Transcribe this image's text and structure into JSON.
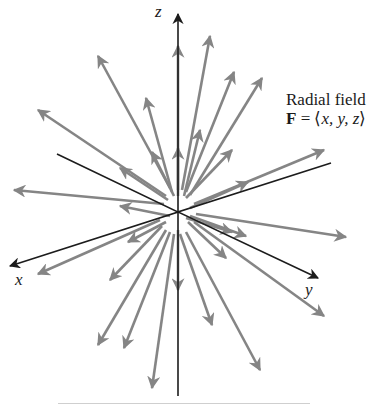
{
  "title": {
    "line1": "Radial field",
    "line2_bold": "F",
    "line2_eq": " = ⟨",
    "line2_vars": "x, y, z",
    "line2_close": "⟩"
  },
  "axes": {
    "x_label": "x",
    "y_label": "y",
    "z_label": "z"
  },
  "colors": {
    "axis": "#1c1c1c",
    "vector": "#858585",
    "background": "#ffffff"
  },
  "diagram": {
    "type": "3d-vector-field",
    "field": "F = <x, y, z>",
    "center": [
      178,
      212
    ],
    "axis_lines": [
      {
        "name": "z-axis",
        "from": [
          178,
          396
        ],
        "to": [
          178,
          14
        ],
        "arrow": true
      },
      {
        "name": "x-axis",
        "from": [
          57,
          154
        ],
        "to": [
          10,
          266
        ],
        "via_center": true,
        "arrow": true
      },
      {
        "name": "y-axis",
        "from": [
          331,
          163
        ],
        "to": [
          318,
          278
        ],
        "via_center": true,
        "arrow": true
      }
    ],
    "vectors": [
      [
        [
          178,
          190
        ],
        [
          178,
          46
        ]
      ],
      [
        [
          182,
          190
        ],
        [
          210,
          36
        ]
      ],
      [
        [
          186,
          192
        ],
        [
          234,
          72
        ]
      ],
      [
        [
          190,
          195
        ],
        [
          262,
          78
        ]
      ],
      [
        [
          170,
          188
        ],
        [
          98,
          56
        ]
      ],
      [
        [
          172,
          192
        ],
        [
          146,
          98
        ]
      ],
      [
        [
          166,
          196
        ],
        [
          38,
          110
        ]
      ],
      [
        [
          164,
          204
        ],
        [
          14,
          190
        ]
      ],
      [
        [
          194,
          204
        ],
        [
          324,
          150
        ]
      ],
      [
        [
          196,
          214
        ],
        [
          346,
          237
        ]
      ],
      [
        [
          194,
          222
        ],
        [
          324,
          316
        ]
      ],
      [
        [
          186,
          232
        ],
        [
          260,
          370
        ]
      ],
      [
        [
          180,
          234
        ],
        [
          212,
          325
        ]
      ],
      [
        [
          174,
          234
        ],
        [
          152,
          388
        ]
      ],
      [
        [
          170,
          232
        ],
        [
          124,
          348
        ]
      ],
      [
        [
          166,
          230
        ],
        [
          98,
          345
        ]
      ],
      [
        [
          162,
          226
        ],
        [
          110,
          280
        ]
      ],
      [
        [
          160,
          220
        ],
        [
          38,
          274
        ]
      ],
      [
        [
          184,
          196
        ],
        [
          200,
          130
        ]
      ],
      [
        [
          186,
          198
        ],
        [
          232,
          150
        ]
      ],
      [
        [
          174,
          196
        ],
        [
          152,
          152
        ]
      ],
      [
        [
          168,
          200
        ],
        [
          120,
          168
        ]
      ],
      [
        [
          190,
          208
        ],
        [
          248,
          182
        ]
      ],
      [
        [
          190,
          216
        ],
        [
          246,
          236
        ]
      ],
      [
        [
          188,
          222
        ],
        [
          226,
          258
        ]
      ],
      [
        [
          166,
          222
        ],
        [
          128,
          242
        ]
      ],
      [
        [
          178,
          196
        ],
        [
          178,
          148
        ]
      ],
      [
        [
          178,
          230
        ],
        [
          178,
          290
        ]
      ],
      [
        [
          186,
          218
        ],
        [
          232,
          232
        ]
      ],
      [
        [
          170,
          216
        ],
        [
          120,
          206
        ]
      ]
    ]
  }
}
